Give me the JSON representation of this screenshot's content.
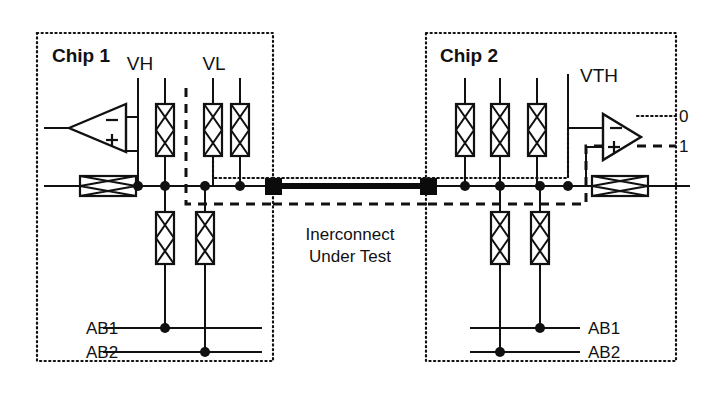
{
  "figure": {
    "kind": "schematic-diagram",
    "title_text": "Inerconnect Under Test",
    "title_line1": "Inerconnect",
    "title_line2": "Under Test"
  },
  "chips": {
    "left": {
      "label": "Chip 1",
      "signals": {
        "vh": "VH",
        "vl": "VL"
      },
      "analog_bus": {
        "ab1": "AB1",
        "ab2": "AB2"
      },
      "comparator": {
        "name": "comparator-chip1",
        "minus": "−",
        "plus": "+",
        "direction": "left"
      }
    },
    "right": {
      "label": "Chip 2",
      "signals": {
        "vth": "VTH"
      },
      "analog_bus": {
        "ab1": "AB1",
        "ab2": "AB2"
      },
      "comparator": {
        "name": "comparator-chip2",
        "minus": "−",
        "plus": "+",
        "direction": "right"
      },
      "outputs": {
        "logic_zero": "0",
        "logic_one": "1"
      }
    }
  },
  "colors": {
    "ink": "#111111",
    "paper": "#ffffff",
    "bus": "#0b0b0b"
  },
  "icons": {
    "switch": "pass-gate-switch-icon",
    "pad": "bond-pad-icon",
    "node": "junction-dot-icon",
    "comparator": "comparator-triangle-icon"
  }
}
